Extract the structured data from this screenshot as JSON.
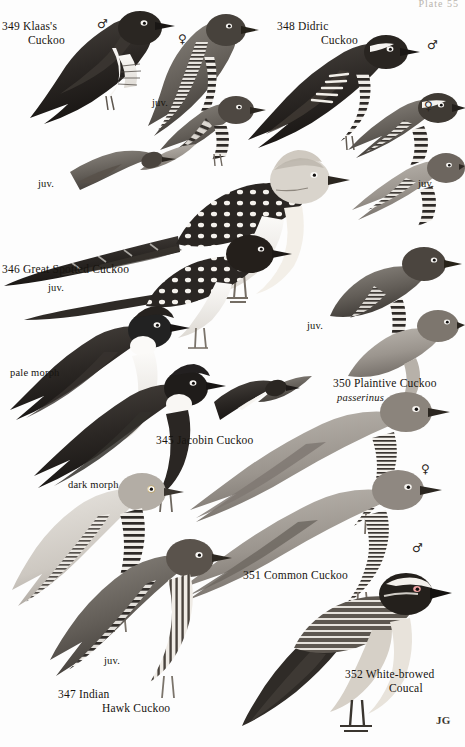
{
  "plate": {
    "number_top_right": "Plate 55",
    "artist_signature": "JG",
    "page_background": "#fdfdfd",
    "ink_color": "#17140f"
  },
  "species": [
    {
      "id": "klaass-cuckoo",
      "number": "349",
      "name_line1": "349  Klaas's",
      "name_line2": "Cuckoo",
      "x": 2,
      "y": 20
    },
    {
      "id": "didric-cuckoo",
      "number": "348",
      "name_line1": "348  Didric",
      "name_line2": "Cuckoo",
      "x": 277,
      "y": 20
    },
    {
      "id": "great-spotted-cuckoo",
      "number": "346",
      "name_line1": "346  Great Spotted Cuckoo",
      "name_line2": "",
      "x": 2,
      "y": 263
    },
    {
      "id": "jacobin-cuckoo",
      "number": "345",
      "name_line1": "345  Jacobin Cuckoo",
      "name_line2": "",
      "x": 156,
      "y": 434
    },
    {
      "id": "plaintive-cuckoo",
      "number": "350",
      "name_line1": "350  Plaintive Cuckoo",
      "name_line2": "",
      "scientific": "passerinus",
      "x": 333,
      "y": 377
    },
    {
      "id": "common-cuckoo",
      "number": "351",
      "name_line1": "351  Common Cuckoo",
      "name_line2": "",
      "x": 243,
      "y": 569
    },
    {
      "id": "indian-hawk-cuckoo",
      "number": "347",
      "name_line1": "347  Indian",
      "name_line2": "Hawk Cuckoo",
      "x": 58,
      "y": 688
    },
    {
      "id": "white-browed-coucal",
      "number": "352",
      "name_line1": "352  White-browed",
      "name_line2": "Coucal",
      "x": 345,
      "y": 668
    }
  ],
  "annotations": {
    "juvenile_label": "juv.",
    "pale_morph_label": "pale morph",
    "dark_morph_label": "dark morph",
    "male_symbol": "♂",
    "female_symbol": "♀"
  },
  "juvenile_markers": [
    {
      "id": "juv-klaass-upper",
      "text": "juv.",
      "x": 152,
      "y": 97
    },
    {
      "id": "juv-klaass-lower",
      "text": "juv.",
      "x": 38,
      "y": 178
    },
    {
      "id": "juv-didric",
      "text": "juv.",
      "x": 418,
      "y": 178
    },
    {
      "id": "juv-great-spotted",
      "text": "juv.",
      "x": 48,
      "y": 282
    },
    {
      "id": "juv-plaintive",
      "text": "juv.",
      "x": 307,
      "y": 320
    },
    {
      "id": "juv-indian-hawk",
      "text": "juv.",
      "x": 104,
      "y": 655
    }
  ],
  "morph_markers": [
    {
      "id": "pale-morph",
      "text": "pale morph",
      "x": 10,
      "y": 367
    },
    {
      "id": "dark-morph",
      "text": "dark morph",
      "x": 68,
      "y": 479
    }
  ],
  "sex_markers": [
    {
      "id": "klaass-male",
      "symbol": "♂",
      "x": 97,
      "y": 17
    },
    {
      "id": "klaass-female",
      "symbol": "♀",
      "x": 178,
      "y": 32
    },
    {
      "id": "didric-male",
      "symbol": "♂",
      "x": 427,
      "y": 38
    },
    {
      "id": "didric-female",
      "symbol": "♀",
      "x": 424,
      "y": 99
    },
    {
      "id": "common-cuckoo-female",
      "symbol": "♀",
      "x": 421,
      "y": 462
    },
    {
      "id": "common-cuckoo-male",
      "symbol": "♂",
      "x": 412,
      "y": 541
    }
  ]
}
